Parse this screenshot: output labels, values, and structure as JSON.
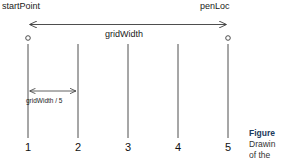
{
  "figure": {
    "type": "technical-diagram",
    "colors": {
      "line": "#3a3a3a",
      "text": "#1a1a1a",
      "caption_title": "#1b3a5c",
      "caption_body": "#333333",
      "background": "#ffffff"
    },
    "labels": {
      "start_point": "startPoint",
      "pen_loc": "penLoc",
      "grid_width": "gridWidth",
      "grid_width_div5": "gridWidth / 5"
    },
    "ticks": [
      {
        "number": "1",
        "x": 28
      },
      {
        "number": "2",
        "x": 78
      },
      {
        "number": "3",
        "x": 128
      },
      {
        "number": "4",
        "x": 178
      },
      {
        "number": "5",
        "x": 228
      }
    ],
    "markers": [
      {
        "name": "start-point-marker",
        "x": 28,
        "y": 38
      },
      {
        "name": "pen-loc-marker",
        "x": 228,
        "y": 38
      }
    ],
    "arrows": [
      {
        "name": "grid-width-arrow",
        "x1": 28,
        "x2": 228,
        "y": 24,
        "double_headed": true
      },
      {
        "name": "grid-width-div5-arrow",
        "x1": 28,
        "x2": 78,
        "y": 91,
        "double_headed": true
      }
    ],
    "vertical_lines": {
      "top": 44,
      "bottom": 138
    },
    "caption": {
      "title": "Figure",
      "line1": "Drawin",
      "line2": "of the"
    }
  }
}
